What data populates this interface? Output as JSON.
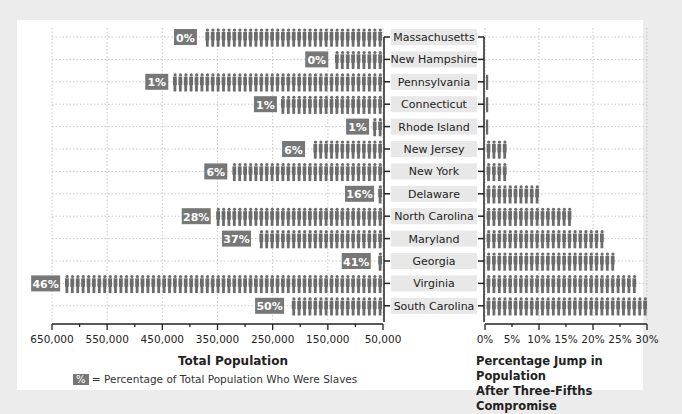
{
  "chart_data": [
    {
      "type": "bar",
      "orientation": "horizontal",
      "title": "",
      "xlabel": "Total Population",
      "ylabel": "",
      "categories": [
        "Massachusetts",
        "New Hampshire",
        "Pennsylvania",
        "Connecticut",
        "Rhode Island",
        "New Jersey",
        "New York",
        "Delaware",
        "North Carolina",
        "Maryland",
        "Georgia",
        "Virginia",
        "South Carolina"
      ],
      "values": [
        380000,
        142000,
        432000,
        235000,
        68000,
        184000,
        325000,
        59000,
        355000,
        282000,
        65000,
        628000,
        222000
      ],
      "slave_percent_labels": [
        "0%",
        "0%",
        "1%",
        "1%",
        "1%",
        "6%",
        "6%",
        "16%",
        "28%",
        "37%",
        "41%",
        "46%",
        "50%"
      ],
      "xlim": [
        650000,
        50000
      ],
      "xticks": [
        "650,000",
        "550,000",
        "450,000",
        "350,000",
        "250,000",
        "150,000",
        "50,000"
      ],
      "grid": true,
      "reversed_axis": true,
      "legend": "% = Percentage of Total Population Who Were Slaves"
    },
    {
      "type": "bar",
      "orientation": "horizontal",
      "title": "",
      "xlabel": "Percentage Jump in Population After Three-Fifths Compromise",
      "categories": [
        "Massachusetts",
        "New Hampshire",
        "Pennsylvania",
        "Connecticut",
        "Rhode Island",
        "New Jersey",
        "New York",
        "Delaware",
        "North Carolina",
        "Maryland",
        "Georgia",
        "Virginia",
        "South Carolina"
      ],
      "values": [
        0,
        0,
        0.5,
        0.5,
        0.5,
        4,
        4,
        10,
        16,
        22,
        24.5,
        28,
        30
      ],
      "xlim": [
        0,
        30
      ],
      "xticks": [
        "0%",
        "5%",
        "10%",
        "15%",
        "20%",
        "25%",
        "30%"
      ],
      "grid": true
    }
  ],
  "left_axis": {
    "title": "Total Population",
    "ticks": [
      "650,000",
      "550,000",
      "450,000",
      "350,000",
      "250,000",
      "150,000",
      "50,000"
    ]
  },
  "right_axis": {
    "title_line1": "Percentage Jump in Population",
    "title_line2": "After Three-Fifths Compromise",
    "ticks": [
      "0%",
      "5%",
      "10%",
      "15%",
      "20%",
      "25%",
      "30%"
    ]
  },
  "legend": {
    "swatch": "%",
    "text": "= Percentage of Total Population Who Were Slaves"
  },
  "colors": {
    "bar": "#6b6b6b",
    "label_box": "#777777",
    "state_box": "#e8e8e8",
    "grid": "#c8c8c8",
    "background": "#ececec",
    "panel": "#ffffff"
  }
}
